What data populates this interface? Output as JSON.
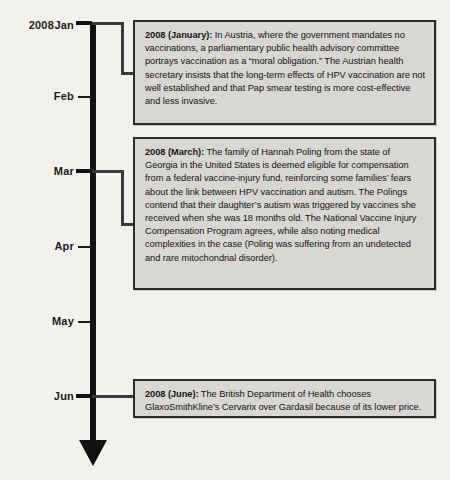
{
  "timeline": {
    "year": "2008",
    "axis": {
      "orientation": "vertical",
      "direction": "downward",
      "arrow": "down-arrow"
    },
    "months": [
      {
        "label": "Jan",
        "y": 22,
        "has_event": true
      },
      {
        "label": "Feb",
        "y": 96,
        "has_event": false
      },
      {
        "label": "Mar",
        "y": 171,
        "has_event": true
      },
      {
        "label": "Apr",
        "y": 246,
        "has_event": false
      },
      {
        "label": "May",
        "y": 321,
        "has_event": false
      },
      {
        "label": "Jun",
        "y": 396,
        "has_event": true
      }
    ],
    "events": [
      {
        "id": "event-january",
        "lead": "2008 (January):",
        "body": " In Austria, where the government mandates no vaccinations, a parliamentary public health advisory committee portrays vaccination as a “moral obligation.” The Austrian health secretary insists that the long-term effects of HPV vaccination are not well established and that Pap smear testing is more cost-effective and less invasive."
      },
      {
        "id": "event-march",
        "lead": "2008 (March):",
        "body": " The family of Hannah Poling from the state of Georgia in the United States is deemed eligible for compensation from a federal vaccine-injury fund, reinforcing some families’ fears about the link between HPV vaccination and autism. The Polings contend that their daughter’s autism was triggered by vaccines she received when she was 18 months old. The National Vaccine Injury Compensation Program agrees, while also noting medical complexities in the case (Poling was suffering from an undetected and rare mitochondrial disorder)."
      },
      {
        "id": "event-june",
        "lead": "2008 (June):",
        "body": " The British Department of Health chooses GlaxoSmithKline’s Cervarix over Gardasil because of its lower price."
      }
    ],
    "colors": {
      "background": "#f3f1ed",
      "axis": "#111111",
      "box_fill": "#d9d7d3",
      "box_border": "#2b2b2b",
      "text": "#141414"
    }
  }
}
